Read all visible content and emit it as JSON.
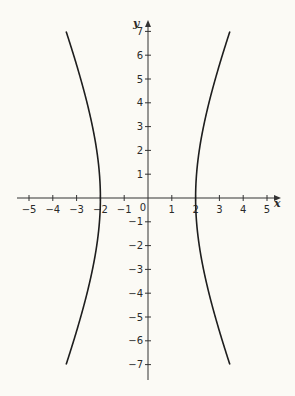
{
  "chart_data": {
    "type": "line",
    "title": "",
    "xlabel": "x",
    "ylabel": "y",
    "xlim": [
      -5.5,
      5.5
    ],
    "ylim": [
      -7.5,
      7.5
    ],
    "grid": false,
    "x_ticks": [
      -5,
      -4,
      -3,
      -2,
      -1,
      0,
      1,
      2,
      3,
      4,
      5
    ],
    "y_ticks": [
      -7,
      -6,
      -5,
      -4,
      -3,
      -2,
      -1,
      1,
      2,
      3,
      4,
      5,
      6,
      7
    ],
    "origin_label": "0",
    "equation": "x^2/4 - y^2/25 = 1",
    "series": [
      {
        "name": "left branch",
        "color": "#1e1e1e",
        "x": [
          -3.44,
          -3.2,
          -2.94,
          -2.69,
          -2.56,
          -2.33,
          -2.15,
          -2.04,
          -2.0,
          -2.04,
          -2.15,
          -2.33,
          -2.56,
          -2.69,
          -2.94,
          -3.2,
          -3.44
        ],
        "y": [
          7,
          6.2,
          5.4,
          4.5,
          4,
          3,
          2,
          1,
          0,
          -1,
          -2,
          -3,
          -4,
          -4.5,
          -5.4,
          -6.2,
          -7
        ]
      },
      {
        "name": "right branch",
        "color": "#1e1e1e",
        "x": [
          3.44,
          3.2,
          2.94,
          2.69,
          2.56,
          2.33,
          2.15,
          2.04,
          2.0,
          2.04,
          2.15,
          2.33,
          2.56,
          2.69,
          2.94,
          3.2,
          3.44
        ],
        "y": [
          7,
          6.2,
          5.4,
          4.5,
          4,
          3,
          2,
          1,
          0,
          -1,
          -2,
          -3,
          -4,
          -4.5,
          -5.4,
          -6.2,
          -7
        ]
      }
    ]
  },
  "layout": {
    "origin_px": [
      148,
      198
    ],
    "unit_px": 23.8,
    "x_axis_px": [
      17,
      281
    ],
    "y_axis_px": [
      20,
      380
    ],
    "background": "#fbfaf5",
    "axis_color": "#333333",
    "curve_color": "#1e1e1e"
  }
}
